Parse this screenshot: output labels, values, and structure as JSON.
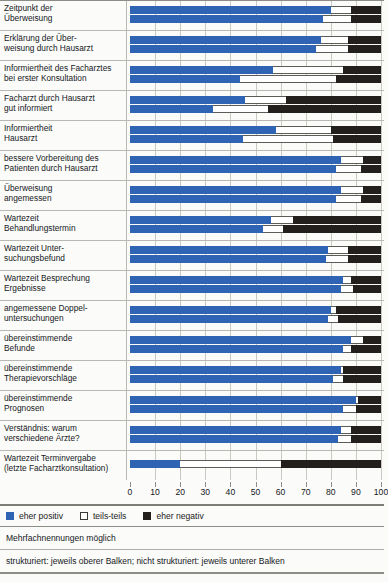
{
  "chart_data": {
    "type": "bar",
    "orientation": "horizontal",
    "stacked": true,
    "title": "",
    "xlabel": "",
    "ylabel": "",
    "xlim": [
      0,
      100
    ],
    "xticks": [
      0,
      10,
      20,
      30,
      40,
      50,
      60,
      70,
      80,
      90,
      100
    ],
    "grid": true,
    "legend_position": "bottom-left",
    "series": [
      {
        "name": "eher positiv",
        "color": "#2f63b4"
      },
      {
        "name": "teils-teils",
        "color": "#ffffff"
      },
      {
        "name": "eher negativ",
        "color": "#231f1d"
      }
    ],
    "group_note": "strukturiert: jeweils oberer Balken; nicht strukturiert: jeweils unterer Balken",
    "categories": [
      {
        "label_lines": [
          "Zeitpunkt der",
          "Überweisung"
        ],
        "bars": [
          {
            "group": "strukturiert",
            "values": [
              80,
              8,
              12
            ]
          },
          {
            "group": "nicht strukturiert",
            "values": [
              77,
              11,
              12
            ]
          }
        ]
      },
      {
        "label_lines": [
          "Erklärung der Über-",
          "weisung durch Hausarzt"
        ],
        "bars": [
          {
            "group": "strukturiert",
            "values": [
              76,
              11,
              13
            ]
          },
          {
            "group": "nicht strukturiert",
            "values": [
              74,
              13,
              13
            ]
          }
        ]
      },
      {
        "label_lines": [
          "Informiertheit des Facharztes",
          "bei erster Konsultation"
        ],
        "bars": [
          {
            "group": "strukturiert",
            "values": [
              57,
              28,
              15
            ]
          },
          {
            "group": "nicht strukturiert",
            "values": [
              44,
              38,
              18
            ]
          }
        ]
      },
      {
        "label_lines": [
          "Facharzt durch Hausarzt",
          "gut informiert"
        ],
        "bars": [
          {
            "group": "strukturiert",
            "values": [
              46,
              16,
              38
            ]
          },
          {
            "group": "nicht strukturiert",
            "values": [
              33,
              22,
              45
            ]
          }
        ]
      },
      {
        "label_lines": [
          "Informiertheit",
          "Hausarzt"
        ],
        "bars": [
          {
            "group": "strukturiert",
            "values": [
              58,
              22,
              20
            ]
          },
          {
            "group": "nicht strukturiert",
            "values": [
              45,
              36,
              19
            ]
          }
        ]
      },
      {
        "label_lines": [
          "bessere Vorbereitung des",
          "Patienten durch Hausarzt"
        ],
        "bars": [
          {
            "group": "strukturiert",
            "values": [
              84,
              9,
              7
            ]
          },
          {
            "group": "nicht strukturiert",
            "values": [
              82,
              10,
              8
            ]
          }
        ]
      },
      {
        "label_lines": [
          "Überweisung",
          "angemessen"
        ],
        "bars": [
          {
            "group": "strukturiert",
            "values": [
              84,
              9,
              7
            ]
          },
          {
            "group": "nicht strukturiert",
            "values": [
              82,
              10,
              8
            ]
          }
        ]
      },
      {
        "label_lines": [
          "Wartezeit",
          "Behandlungstermin"
        ],
        "bars": [
          {
            "group": "strukturiert",
            "values": [
              56,
              9,
              35
            ]
          },
          {
            "group": "nicht strukturiert",
            "values": [
              53,
              8,
              39
            ]
          }
        ]
      },
      {
        "label_lines": [
          "Wartezeit Unter-",
          "suchungsbefund"
        ],
        "bars": [
          {
            "group": "strukturiert",
            "values": [
              79,
              8,
              13
            ]
          },
          {
            "group": "nicht strukturiert",
            "values": [
              78,
              9,
              13
            ]
          }
        ]
      },
      {
        "label_lines": [
          "Wartezeit Besprechung",
          "Ergebnisse"
        ],
        "bars": [
          {
            "group": "strukturiert",
            "values": [
              85,
              3,
              12
            ]
          },
          {
            "group": "nicht strukturiert",
            "values": [
              84,
              5,
              11
            ]
          }
        ]
      },
      {
        "label_lines": [
          "angemessene Doppel-",
          "untersuchungen"
        ],
        "bars": [
          {
            "group": "strukturiert",
            "values": [
              80,
              2,
              18
            ]
          },
          {
            "group": "nicht strukturiert",
            "values": [
              79,
              4,
              17
            ]
          }
        ]
      },
      {
        "label_lines": [
          "übereinstimmende",
          "Befunde"
        ],
        "bars": [
          {
            "group": "strukturiert",
            "values": [
              88,
              5,
              7
            ]
          },
          {
            "group": "nicht strukturiert",
            "values": [
              85,
              3,
              12
            ]
          }
        ]
      },
      {
        "label_lines": [
          "übereinstimmende",
          "Therapievorschläge"
        ],
        "bars": [
          {
            "group": "strukturiert",
            "values": [
              84,
              1,
              15
            ]
          },
          {
            "group": "nicht strukturiert",
            "values": [
              81,
              4,
              15
            ]
          }
        ]
      },
      {
        "label_lines": [
          "übereinstimmende",
          "Prognosen"
        ],
        "bars": [
          {
            "group": "strukturiert",
            "values": [
              90,
              1,
              9
            ]
          },
          {
            "group": "nicht strukturiert",
            "values": [
              85,
              5,
              10
            ]
          }
        ]
      },
      {
        "label_lines": [
          "Verständnis: warum",
          "verschiedene Ärzte?"
        ],
        "bars": [
          {
            "group": "strukturiert",
            "values": [
              84,
              4,
              12
            ]
          },
          {
            "group": "nicht strukturiert",
            "values": [
              83,
              5,
              12
            ]
          }
        ]
      },
      {
        "label_lines": [
          "Wartezeit Terminvergabe",
          "(letzte Facharztkonsultation)"
        ],
        "bars": [
          {
            "group": "strukturiert",
            "values": [
              20,
              40,
              40
            ]
          }
        ]
      }
    ]
  },
  "legend": {
    "items": [
      {
        "label": "eher positiv",
        "swatch": "pos"
      },
      {
        "label": "teils-teils",
        "swatch": "mid"
      },
      {
        "label": "eher negativ",
        "swatch": "neg"
      }
    ]
  },
  "notes": {
    "multiple": "Mehrfachnennungen möglich",
    "structure": "strukturiert: jeweils oberer Balken; nicht strukturiert: jeweils unterer Balken"
  },
  "axis": {
    "ticks": [
      "0",
      "10",
      "20",
      "30",
      "40",
      "50",
      "60",
      "70",
      "80",
      "90",
      "100"
    ]
  },
  "colors": {
    "positive": "#2f63b4",
    "neutral": "#ffffff",
    "negative": "#231f1d",
    "grid": "#c9c9c4",
    "rule": "#8d8d88"
  }
}
